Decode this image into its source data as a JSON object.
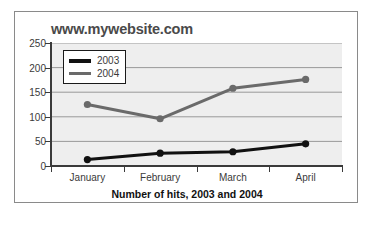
{
  "chart_data": {
    "type": "line",
    "title": "www.mywebsite.com",
    "caption": "Number of hits, 2003 and 2004",
    "xlabel": "",
    "ylabel": "",
    "categories": [
      "January",
      "February",
      "March",
      "April"
    ],
    "series": [
      {
        "name": "2003",
        "values": [
          13,
          26,
          29,
          45
        ],
        "color": "#111111"
      },
      {
        "name": "2004",
        "values": [
          125,
          96,
          158,
          176
        ],
        "color": "#6a6a6a"
      }
    ],
    "ylim": [
      0,
      250
    ],
    "yticks": [
      0,
      50,
      100,
      150,
      200,
      250
    ],
    "ytick_labels": [
      "0",
      "50",
      "100",
      "150",
      "200",
      "250"
    ],
    "grid": true,
    "grid_color": "#999999",
    "plot_background": "#eeeeee",
    "legend_position": "upper-left",
    "marker": "circle"
  },
  "legend": {
    "items": [
      {
        "label": "2003",
        "color": "#111111"
      },
      {
        "label": "2004",
        "color": "#6a6a6a"
      }
    ]
  }
}
